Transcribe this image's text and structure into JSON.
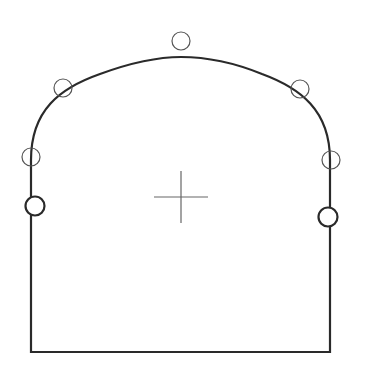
{
  "diagram": {
    "type": "tunnel-cross-section",
    "canvas": {
      "width": 368,
      "height": 388,
      "background": "#ffffff"
    },
    "stroke_color": "#2a2a2a",
    "thin_stroke_color": "#555555",
    "outline": {
      "left_x": 31,
      "right_x": 330,
      "bottom_y": 352,
      "left_spring_y": 160,
      "right_spring_y": 160,
      "crown_y": 57,
      "crown_x": 181
    },
    "thin_markers": [
      {
        "id": "crown",
        "cx": 181,
        "cy": 41,
        "r": 9
      },
      {
        "id": "upper-left",
        "cx": 63,
        "cy": 88,
        "r": 9
      },
      {
        "id": "upper-right",
        "cx": 300,
        "cy": 89,
        "r": 9
      },
      {
        "id": "mid-left",
        "cx": 31,
        "cy": 157,
        "r": 9
      },
      {
        "id": "mid-right",
        "cx": 331,
        "cy": 160,
        "r": 9
      }
    ],
    "bold_markers": [
      {
        "id": "lower-left",
        "cx": 35,
        "cy": 206,
        "r": 9.5
      },
      {
        "id": "lower-right",
        "cx": 328,
        "cy": 217,
        "r": 9.5
      }
    ],
    "center_cross": {
      "cx": 181,
      "cy": 197,
      "half_w": 27,
      "half_h": 26
    }
  }
}
